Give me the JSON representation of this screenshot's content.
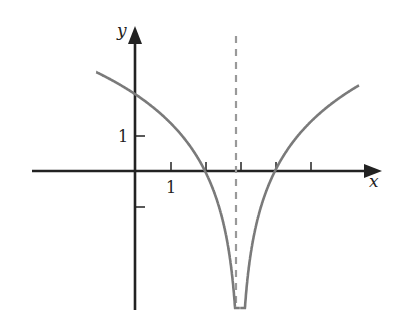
{
  "header_fragment": {
    "text": "y = ... ( ... )",
    "note_visible": "partially cropped at top"
  },
  "chart_data": {
    "type": "line",
    "title": "",
    "xlabel": "x",
    "ylabel": "y",
    "function": "y = 2 ln|x - 3|",
    "vertical_asymptote": {
      "x": 3,
      "style": "dashed"
    },
    "x_ticks": [
      1,
      2,
      3,
      4,
      5
    ],
    "x_tick_labels": [
      {
        "x": 1,
        "label": "1"
      }
    ],
    "y_ticks": [
      -1,
      1
    ],
    "y_tick_labels": [
      {
        "y": 1,
        "label": "1"
      }
    ],
    "xlim": [
      -3,
      7
    ],
    "ylim": [
      -4,
      4.2
    ],
    "grid": false,
    "series": [
      {
        "name": "left branch",
        "x": [
          -1.1,
          -0.5,
          0,
          0.5,
          1,
          1.5,
          2,
          2.5,
          2.9,
          3.0
        ],
        "y": [
          2.82,
          2.51,
          2.2,
          1.83,
          1.39,
          0.81,
          0,
          -1.39,
          -4.6,
          -4
        ]
      },
      {
        "name": "right branch",
        "x": [
          3.0,
          3.1,
          3.5,
          4,
          4.5,
          5,
          5.5,
          6.4
        ],
        "y": [
          -4,
          -4.6,
          -1.39,
          0,
          0.81,
          1.39,
          1.83,
          2.45
        ]
      }
    ],
    "colors": {
      "curve": "#7a7a7a",
      "axes": "#222222",
      "asymptote": "#999999"
    }
  }
}
